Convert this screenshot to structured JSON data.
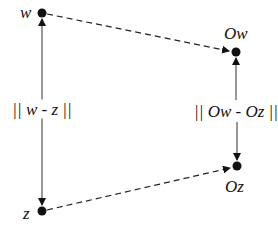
{
  "diagram": {
    "type": "mapping-distance-diagram",
    "nodes": {
      "w": {
        "label": "w",
        "x": 42,
        "y": 13
      },
      "z": {
        "label": "z",
        "x": 42,
        "y": 211
      },
      "Ow": {
        "label": "Ow",
        "x": 236,
        "y": 52
      },
      "Oz": {
        "label": "Oz",
        "x": 237,
        "y": 166
      }
    },
    "edges": [
      {
        "from": "w",
        "to": "Ow",
        "style": "dashed",
        "arrow": "end"
      },
      {
        "from": "z",
        "to": "Oz",
        "style": "dashed",
        "arrow": "end"
      },
      {
        "from": "w",
        "to": "z",
        "style": "solid",
        "arrow": "both",
        "label": "|| w - z ||"
      },
      {
        "from": "Ow",
        "to": "Oz",
        "style": "solid",
        "arrow": "both",
        "label": "|| Ow - Oz ||"
      }
    ],
    "labels": {
      "w": "w",
      "z": "z",
      "Ow": "Ow",
      "Oz": "Oz",
      "dist_wz": "|| w - z ||",
      "dist_OwOz": "|| Ow - Oz ||"
    },
    "colors": {
      "ink": "#111111",
      "solid_line": "#333333",
      "background": "#ffffff"
    }
  }
}
